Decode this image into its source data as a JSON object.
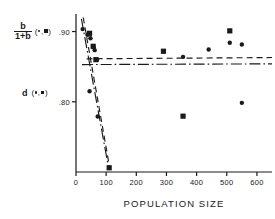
{
  "chart_data": {
    "type": "scatter",
    "title": "",
    "xlabel": "POPULATION   SIZE",
    "ylabel_primary": "b/1+b",
    "ylabel_primary_numerator": "b",
    "ylabel_primary_denominator": "1+b",
    "ylabel_primary_symbols": "(•,■)",
    "ylabel_secondary": "d",
    "ylabel_secondary_symbols": "(•,■)",
    "xlim": [
      0,
      650
    ],
    "ylim": [
      0.7,
      0.925
    ],
    "xticks": [
      0,
      100,
      200,
      300,
      400,
      500,
      600
    ],
    "xticklabels": [
      "0",
      "100",
      "200",
      "300",
      "400",
      "500",
      "600"
    ],
    "yticks": [
      0.9,
      0.8
    ],
    "yticklabels": [
      ".90",
      ".80"
    ],
    "grid": false,
    "legend": "none",
    "series": [
      {
        "name": "b/1+b (circles)",
        "marker": "circle",
        "points": [
          {
            "x": 22,
            "y": 0.9035
          },
          {
            "x": 38,
            "y": 0.8955
          },
          {
            "x": 48,
            "y": 0.8905
          },
          {
            "x": 58,
            "y": 0.8775
          },
          {
            "x": 62,
            "y": 0.8735
          },
          {
            "x": 70,
            "y": 0.86
          },
          {
            "x": 290,
            "y": 0.8715
          },
          {
            "x": 355,
            "y": 0.864
          },
          {
            "x": 440,
            "y": 0.8745
          },
          {
            "x": 510,
            "y": 0.884
          },
          {
            "x": 550,
            "y": 0.8815
          }
        ]
      },
      {
        "name": "b/1+b (squares)",
        "marker": "square",
        "points": [
          {
            "x": 45,
            "y": 0.8975
          },
          {
            "x": 57,
            "y": 0.879
          },
          {
            "x": 66,
            "y": 0.86
          },
          {
            "x": 290,
            "y": 0.872
          },
          {
            "x": 510,
            "y": 0.901
          }
        ]
      },
      {
        "name": "d (circles)",
        "marker": "circle",
        "points": [
          {
            "x": 45,
            "y": 0.815
          },
          {
            "x": 72,
            "y": 0.779
          },
          {
            "x": 550,
            "y": 0.7985
          }
        ]
      },
      {
        "name": "d (squares)",
        "marker": "square",
        "points": [
          {
            "x": 110,
            "y": 0.706
          },
          {
            "x": 355,
            "y": 0.7795
          }
        ]
      }
    ],
    "fit_lines": [
      {
        "name": "dashed-descending",
        "style": "dashed",
        "x0": 24,
        "y0": 0.92,
        "x1": 112,
        "y1": 0.7055
      },
      {
        "name": "dashdot-descending",
        "style": "dashdot",
        "x0": 18,
        "y0": 0.918,
        "x1": 108,
        "y1": 0.706
      },
      {
        "name": "dashed-horizontal",
        "style": "dashed",
        "x0": 35,
        "y0": 0.8612,
        "x1": 650,
        "y1": 0.863
      },
      {
        "name": "dashdot-horizontal",
        "style": "dashdot",
        "x0": 20,
        "y0": 0.853,
        "x1": 650,
        "y1": 0.854
      }
    ]
  },
  "axes": {
    "x_axis_name": "x-axis",
    "y_axis_name": "y-axis"
  }
}
